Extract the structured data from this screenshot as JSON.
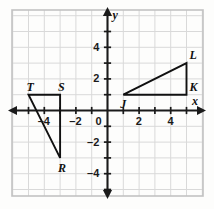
{
  "figure": {
    "background_color": "#fdfdfc",
    "grid_color": "#d9d9d9",
    "frame_color": "#c2c2c2",
    "axis_color": "#1a1a1a",
    "shape_color": "#111111"
  },
  "chart_data": {
    "type": "scatter",
    "title": "",
    "xlabel": "x",
    "ylabel": "y",
    "xlim": [
      -6,
      6
    ],
    "ylim": [
      -5,
      5
    ],
    "grid": true,
    "legend": "none",
    "x_ticks": [
      -4,
      -2,
      0,
      2,
      4
    ],
    "y_ticks": [
      4,
      2,
      0,
      -2,
      -4
    ],
    "x_tick_labels": [
      "–4",
      "–2",
      "0",
      "2",
      "4"
    ],
    "y_tick_labels": [
      "4",
      "2",
      "0",
      "–2",
      "–4"
    ],
    "origin_label": "0",
    "series": [
      {
        "name": "Triangle TSR",
        "closed": true,
        "points": [
          {
            "label": "T",
            "x": -5,
            "y": 1,
            "label_dx": -2,
            "label_dy": -14
          },
          {
            "label": "S",
            "x": -3,
            "y": 1,
            "label_dx": -2,
            "label_dy": -14
          },
          {
            "label": "R",
            "x": -3,
            "y": -3,
            "label_dx": -2,
            "label_dy": 4
          }
        ]
      },
      {
        "name": "Triangle JKL",
        "closed": true,
        "points": [
          {
            "label": "J",
            "x": 1,
            "y": 1,
            "label_dx": -3,
            "label_dy": 3
          },
          {
            "label": "K",
            "x": 5,
            "y": 1,
            "label_dx": 3,
            "label_dy": -14
          },
          {
            "label": "L",
            "x": 5,
            "y": 3,
            "label_dx": 3,
            "label_dy": -14
          }
        ]
      }
    ]
  },
  "axis_names": {
    "x": "x",
    "y": "y"
  }
}
